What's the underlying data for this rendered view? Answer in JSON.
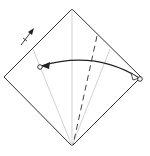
{
  "diagram": {
    "type": "origami-fold-instruction",
    "colors": {
      "outline": "#333333",
      "crease": "#bbbbbb",
      "valley_fold": "#444444",
      "arrow": "#222222",
      "background": "#ffffff"
    },
    "paper": {
      "shape": "diamond",
      "top": [
        72,
        9
      ],
      "right": [
        141,
        77
      ],
      "bottom": [
        72,
        146
      ],
      "left": [
        4,
        77
      ]
    },
    "creases": [
      {
        "name": "center-crease",
        "from": [
          72,
          9
        ],
        "to": [
          72,
          146
        ]
      },
      {
        "name": "left-kite-crease",
        "from": [
          33,
          49
        ],
        "to": [
          72,
          146
        ]
      },
      {
        "name": "right-kite-crease",
        "from": [
          110,
          49
        ],
        "to": [
          72,
          146
        ]
      }
    ],
    "valley_fold_line": {
      "from": [
        97,
        36
      ],
      "to": [
        73,
        145
      ]
    },
    "fold_arrow": {
      "from": [
        139,
        78
      ],
      "to": [
        41,
        66
      ],
      "control": [
        95,
        50
      ]
    },
    "reference_points": [
      {
        "name": "start-point",
        "at": [
          140,
          79
        ]
      },
      {
        "name": "target-point",
        "at": [
          40,
          67
        ]
      }
    ],
    "turn_over_arrow": {
      "from": [
        21,
        45
      ],
      "to": [
        33,
        30
      ],
      "tick": [
        24,
        41
      ]
    }
  }
}
